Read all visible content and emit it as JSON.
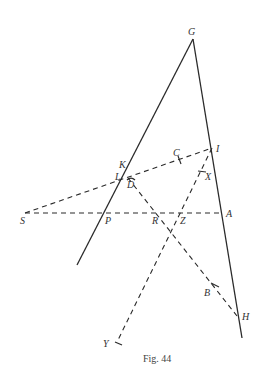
{
  "figure": {
    "caption": "Fig. 44",
    "points": {
      "G": {
        "label": "G",
        "x": 193,
        "y": 39
      },
      "I": {
        "label": "I",
        "x": 212,
        "y": 148
      },
      "C": {
        "label": "C",
        "x": 180,
        "y": 160
      },
      "X": {
        "label": "X",
        "x": 202,
        "y": 171
      },
      "K": {
        "label": "K",
        "x": 128,
        "y": 168
      },
      "L": {
        "label": "L",
        "x": 126,
        "y": 174
      },
      "D": {
        "label": "D",
        "x": 130,
        "y": 178
      },
      "S": {
        "label": "S",
        "x": 25,
        "y": 213
      },
      "P": {
        "label": "P",
        "x": 107,
        "y": 213
      },
      "R": {
        "label": "R",
        "x": 163,
        "y": 213
      },
      "Z": {
        "label": "Z",
        "x": 180,
        "y": 213
      },
      "A": {
        "label": "A",
        "x": 222,
        "y": 213
      },
      "B": {
        "label": "B",
        "x": 215,
        "y": 285
      },
      "H": {
        "label": "H",
        "x": 237,
        "y": 316
      },
      "Y": {
        "label": "Y",
        "x": 117,
        "y": 342
      }
    },
    "solid_lines": [
      {
        "from": "G",
        "to": "left-end"
      },
      {
        "from": "G",
        "to": "right-end"
      }
    ],
    "dashed_lines": [
      {
        "from": "S",
        "to": "I"
      },
      {
        "from": "S",
        "to": "A"
      },
      {
        "from": "D",
        "to": "H"
      },
      {
        "from": "I",
        "to": "Y"
      }
    ]
  }
}
